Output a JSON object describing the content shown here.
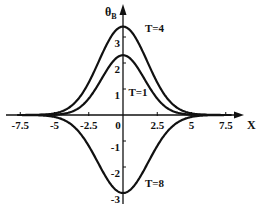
{
  "chart_data": {
    "type": "line",
    "title": "",
    "xlabel": "X",
    "ylabel": "θB",
    "ylabel_main": "θ",
    "ylabel_sub": "B",
    "xlim": [
      -7.8,
      8.0
    ],
    "ylim": [
      -3.3,
      3.9
    ],
    "grid": false,
    "legend": "inline annotations",
    "x_ticks": [
      -7.5,
      -5,
      -2.5,
      0,
      2.5,
      5,
      7.5
    ],
    "x_tick_labels": [
      "-7.5",
      "-5",
      "-2.5",
      "0",
      "2.5",
      "5",
      "7.5"
    ],
    "y_ticks": [
      -3,
      -2,
      -1,
      1,
      2,
      3
    ],
    "y_tick_labels": [
      "-3",
      "-2",
      "-1",
      "1",
      "2",
      "3"
    ],
    "series": [
      {
        "name": "T=1",
        "peak": 2.3,
        "width": 2.2,
        "annotation": "T=1",
        "annotation_pos": [
          0.4,
          0.75
        ],
        "x": [
          -7.5,
          -5,
          -4,
          -3,
          -2,
          -1,
          0,
          1,
          2,
          3,
          4,
          5,
          7.5
        ],
        "values": [
          0.0,
          0.02,
          0.09,
          0.32,
          0.86,
          1.78,
          2.3,
          1.78,
          0.86,
          0.32,
          0.09,
          0.02,
          0.0
        ]
      },
      {
        "name": "T=4",
        "peak": 3.4,
        "width": 2.5,
        "annotation": "T=4",
        "annotation_pos": [
          1.6,
          3.2
        ],
        "x": [
          -7.5,
          -5,
          -4,
          -3,
          -2,
          -1,
          0,
          1,
          2,
          3,
          4,
          5,
          7.5
        ],
        "values": [
          0.0,
          0.05,
          0.24,
          0.72,
          1.64,
          2.83,
          3.4,
          2.83,
          1.64,
          0.72,
          0.24,
          0.05,
          0.0
        ]
      },
      {
        "name": "T=8",
        "peak": -3.0,
        "width": 2.6,
        "annotation": "T=8",
        "annotation_pos": [
          1.6,
          -2.75
        ],
        "x": [
          -7.5,
          -5,
          -4,
          -3,
          -2,
          -1,
          0,
          1,
          2,
          3,
          4,
          5,
          7.5
        ],
        "values": [
          0.0,
          -0.06,
          -0.28,
          -0.78,
          -1.6,
          -2.58,
          -3.0,
          -2.58,
          -1.6,
          -0.78,
          -0.28,
          -0.06,
          0.0
        ]
      }
    ]
  },
  "colors": {
    "line": "#111111",
    "background": "#ffffff"
  }
}
